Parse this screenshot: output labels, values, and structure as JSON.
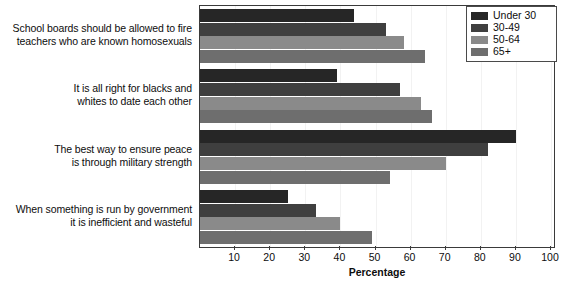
{
  "chart_data": {
    "type": "bar",
    "orientation": "horizontal",
    "title": "",
    "xlabel": "Percentage",
    "ylabel": "",
    "xlim": [
      0,
      100
    ],
    "xticks": [
      10,
      20,
      30,
      40,
      50,
      60,
      70,
      80,
      90,
      100
    ],
    "grid": true,
    "grid_axis": "x",
    "legend_position": "top-right",
    "categories": [
      "School boards should be allowed to fire teachers who are known homosexuals",
      "It is all right for blacks and whites to date each other",
      "The best way to ensure peace is through military strength",
      "When something is run by government it is inefficient and wasteful"
    ],
    "category_lines": [
      [
        "School boards should be allowed to fire",
        "teachers who are known homosexuals"
      ],
      [
        "It is all right for blacks and",
        "whites to date each other"
      ],
      [
        "The best way to ensure peace",
        "is through military strength"
      ],
      [
        "When something is run by government",
        "it is inefficient and wasteful"
      ]
    ],
    "series": [
      {
        "name": "Under 30",
        "color": "#262626",
        "values": [
          44,
          39,
          90,
          25
        ]
      },
      {
        "name": "30-49",
        "color": "#3f3f3f",
        "values": [
          53,
          57,
          82,
          33
        ]
      },
      {
        "name": "50-64",
        "color": "#8a8a8a",
        "values": [
          58,
          63,
          70,
          40
        ]
      },
      {
        "name": "65+",
        "color": "#6e6e6e",
        "values": [
          64,
          66,
          54,
          49
        ]
      }
    ]
  },
  "legend": {
    "entries": [
      {
        "label": "Under 30",
        "color": "#262626"
      },
      {
        "label": "30-49",
        "color": "#3f3f3f"
      },
      {
        "label": "50-64",
        "color": "#8a8a8a"
      },
      {
        "label": "65+",
        "color": "#6e6e6e"
      }
    ]
  },
  "axis": {
    "title": "Percentage",
    "tick_labels": [
      "10",
      "20",
      "30",
      "40",
      "50",
      "60",
      "70",
      "80",
      "90",
      "100"
    ]
  }
}
